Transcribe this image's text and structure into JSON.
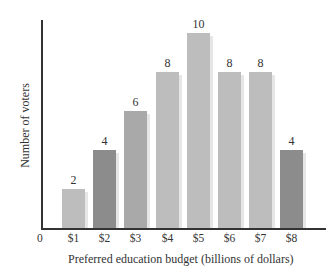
{
  "chart_data": {
    "type": "bar",
    "title": "",
    "xlabel": "Preferred education budget (billions of dollars)",
    "ylabel": "Number of voters",
    "origin_label": "0",
    "categories": [
      "$1",
      "$2",
      "$3",
      "$4",
      "$5",
      "$6",
      "$7",
      "$8"
    ],
    "values": [
      2,
      4,
      6,
      8,
      10,
      8,
      8,
      4
    ],
    "data_labels": [
      "2",
      "4",
      "6",
      "8",
      "10",
      "8",
      "8",
      "4"
    ],
    "ylim": [
      0,
      10.5
    ],
    "grid": false,
    "legend": null,
    "bar_colors": [
      "#bdbdbd",
      "#8c8c8c",
      "#a9a9a9",
      "#bdbdbd",
      "#bdbdbd",
      "#bdbdbd",
      "#bdbdbd",
      "#8c8c8c"
    ]
  }
}
